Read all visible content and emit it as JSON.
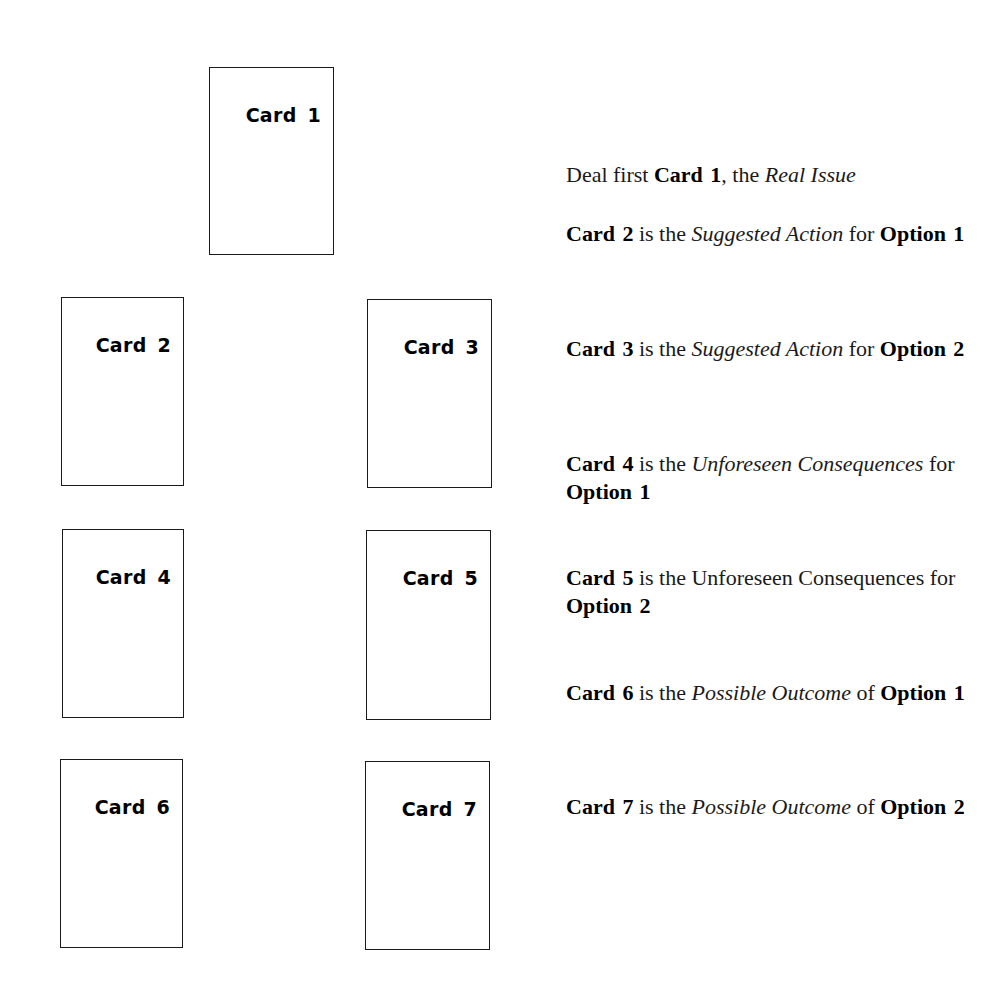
{
  "cards": [
    {
      "label": "Card 1",
      "left": 209,
      "top": 67,
      "width": 125,
      "height": 188
    },
    {
      "label": "Card 2",
      "left": 61,
      "top": 297,
      "width": 123,
      "height": 189
    },
    {
      "label": "Card 3",
      "left": 367,
      "top": 299,
      "width": 125,
      "height": 189
    },
    {
      "label": "Card 4",
      "left": 62,
      "top": 529,
      "width": 122,
      "height": 189
    },
    {
      "label": "Card 5",
      "left": 366,
      "top": 530,
      "width": 125,
      "height": 190
    },
    {
      "label": "Card 6",
      "left": 60,
      "top": 759,
      "width": 123,
      "height": 189
    },
    {
      "label": "Card 7",
      "left": 365,
      "top": 761,
      "width": 125,
      "height": 189
    }
  ],
  "descriptions": [
    {
      "top": 161,
      "segments": [
        {
          "text": "Deal first ",
          "style": "normal"
        },
        {
          "text": "Card 1",
          "style": "bold"
        },
        {
          "text": ", the ",
          "style": "normal"
        },
        {
          "text": "Real Issue",
          "style": "italic"
        }
      ]
    },
    {
      "top": 220,
      "segments": [
        {
          "text": "Card 2",
          "style": "bold"
        },
        {
          "text": " is the ",
          "style": "normal"
        },
        {
          "text": "Suggested Action",
          "style": "italic"
        },
        {
          "text": " for ",
          "style": "normal"
        },
        {
          "text": "Option 1",
          "style": "bold"
        }
      ]
    },
    {
      "top": 335,
      "segments": [
        {
          "text": "Card 3",
          "style": "bold"
        },
        {
          "text": " is the ",
          "style": "normal"
        },
        {
          "text": "Suggested Action",
          "style": "italic"
        },
        {
          "text": " for ",
          "style": "normal"
        },
        {
          "text": "Option 2",
          "style": "bold"
        }
      ]
    },
    {
      "top": 450,
      "segments": [
        {
          "text": "Card 4",
          "style": "bold"
        },
        {
          "text": " is the ",
          "style": "normal"
        },
        {
          "text": "Unforeseen Consequences",
          "style": "italic"
        },
        {
          "text": " for ",
          "style": "normal"
        },
        {
          "text": "Option 1",
          "style": "bold"
        }
      ]
    },
    {
      "top": 564,
      "segments": [
        {
          "text": "Card 5",
          "style": "bold"
        },
        {
          "text": " is the Unforeseen Consequences for ",
          "style": "normal"
        },
        {
          "text": "Option 2",
          "style": "bold"
        }
      ]
    },
    {
      "top": 679,
      "segments": [
        {
          "text": "Card 6",
          "style": "bold"
        },
        {
          "text": " is the ",
          "style": "normal"
        },
        {
          "text": "Possible Outcome",
          "style": "italic"
        },
        {
          "text": " of ",
          "style": "normal"
        },
        {
          "text": "Option 1",
          "style": "bold"
        }
      ]
    },
    {
      "top": 793,
      "segments": [
        {
          "text": "Card 7",
          "style": "bold"
        },
        {
          "text": " is the ",
          "style": "normal"
        },
        {
          "text": "Possible Outcome",
          "style": "italic"
        },
        {
          "text": " of ",
          "style": "normal"
        },
        {
          "text": "Option 2",
          "style": "bold"
        }
      ]
    }
  ]
}
